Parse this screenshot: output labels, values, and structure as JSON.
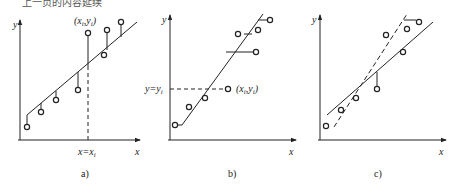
{
  "header": {
    "cropped_text": "上一页的内容延续"
  },
  "panels": [
    {
      "id": "a",
      "caption": "a)",
      "y_axis_label": "y",
      "x_axis_label": "x",
      "point_label": "(x_i,y_i)",
      "point_label_main": "(x",
      "point_label_sub1": "i",
      "point_label_mid": ",y",
      "point_label_sub2": "i",
      "point_label_end": ")",
      "vline_label_main": "x=x",
      "vline_label_sub": "i",
      "description": "Vertical residuals (y-direction) from data points to fitted line"
    },
    {
      "id": "b",
      "caption": "b)",
      "y_axis_label": "y",
      "x_axis_label": "x",
      "point_label_main": "(x",
      "point_label_sub1": "i",
      "point_label_mid": ",y",
      "point_label_sub2": "i",
      "point_label_end": ")",
      "hline_label_main": "y=y",
      "hline_label_sub": "i",
      "description": "Horizontal residuals (x-direction) from data points to fitted line"
    },
    {
      "id": "c",
      "caption": "c)",
      "y_axis_label": "y",
      "x_axis_label": "x",
      "description": "Comparison of two regression lines: solid (y on x) and dashed (x on y)"
    }
  ],
  "colors": {
    "stroke": "#222222",
    "background": "#ffffff"
  }
}
